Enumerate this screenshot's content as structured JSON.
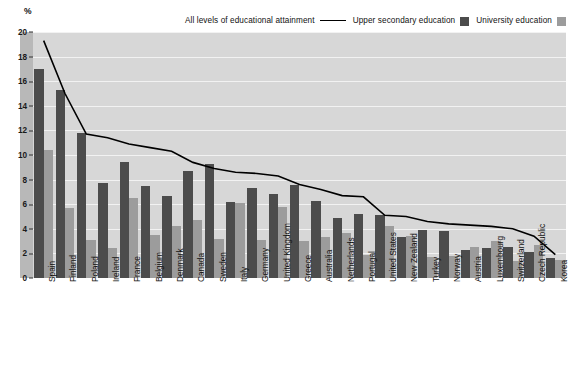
{
  "axis": {
    "unit_label": "%",
    "y_ticks": [
      0,
      2,
      4,
      6,
      8,
      10,
      12,
      14,
      16,
      18,
      20
    ]
  },
  "legend": {
    "items": [
      {
        "label": "All levels of educational attainment",
        "marker": "line",
        "color": "#000000"
      },
      {
        "label": "Upper secondary education",
        "marker": "swatch",
        "color": "#4c4c4c"
      },
      {
        "label": "University education",
        "marker": "swatch",
        "color": "#9c9c9c"
      }
    ]
  },
  "colors": {
    "upper_secondary": "#4c4c4c",
    "university": "#9c9c9c",
    "all_levels_line": "#000000",
    "plot_background": "#d7d7d7",
    "gridline": "#f2f2f2",
    "axis_strip": "#b8b8b8"
  },
  "chart_data": {
    "type": "bar",
    "title": "",
    "subtitle": "",
    "xlabel": "",
    "ylabel": "%",
    "ylim": [
      0,
      20
    ],
    "grid": true,
    "legend_position": "top-right",
    "categories": [
      "Spain",
      "Finland",
      "Poland",
      "Ireland",
      "France",
      "Belgium",
      "Denmark",
      "Canada",
      "Sweden",
      "Italy",
      "Germany",
      "United Kingdom",
      "Greece",
      "Australia",
      "Netherlands",
      "Portugal",
      "United States",
      "New Zealand",
      "Turkey",
      "Norway",
      "Austria",
      "Luxembourg",
      "Switzerland",
      "Czech Republic",
      "Korea"
    ],
    "series": [
      {
        "name": "Upper secondary education",
        "type": "bar",
        "color": "#4c4c4c",
        "values": [
          17.0,
          15.3,
          11.8,
          7.7,
          9.4,
          7.5,
          6.7,
          8.7,
          9.3,
          6.2,
          7.3,
          6.8,
          7.6,
          6.3,
          4.9,
          5.2,
          5.1,
          3.3,
          3.9,
          3.8,
          2.3,
          2.4,
          2.5,
          2.1,
          1.6
        ],
        "ylim": [
          0,
          20
        ]
      },
      {
        "name": "University education",
        "type": "bar",
        "color": "#9c9c9c",
        "values": [
          10.4,
          5.7,
          3.1,
          2.4,
          6.5,
          3.5,
          4.2,
          4.7,
          3.2,
          6.1,
          3.1,
          5.8,
          3.0,
          3.3,
          3.7,
          1.9,
          4.2,
          3.4,
          1.7,
          1.8,
          2.5,
          3.0,
          1.4,
          2.7,
          1.5
        ],
        "ylim": [
          0,
          20
        ]
      },
      {
        "name": "All levels of educational attainment",
        "type": "line",
        "color": "#000000",
        "values": [
          19.3,
          15.0,
          11.7,
          11.4,
          10.9,
          10.6,
          10.3,
          9.4,
          8.9,
          8.6,
          8.5,
          8.3,
          7.6,
          7.2,
          6.7,
          6.6,
          5.1,
          5.0,
          4.6,
          4.4,
          4.3,
          4.2,
          4.0,
          3.4,
          1.9
        ]
      }
    ]
  }
}
